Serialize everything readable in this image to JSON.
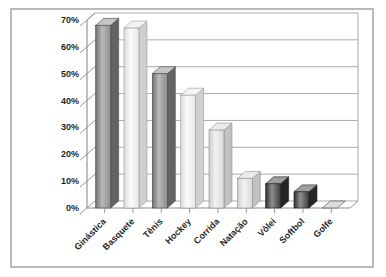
{
  "frame": {
    "border_color": "#a9a9a9",
    "background": "#ffffff"
  },
  "chart_data": {
    "type": "bar",
    "style": "3d-column",
    "title": "",
    "xlabel": "",
    "ylabel": "",
    "unit": "%",
    "categories": [
      "Ginástica",
      "Basquete",
      "Tênis",
      "Hockey",
      "Corrida",
      "Natação",
      "Vôlei",
      "Softbol",
      "Golfe"
    ],
    "values": [
      68,
      67,
      50,
      42,
      29,
      11,
      9,
      6,
      0
    ],
    "ylim": [
      0,
      70
    ],
    "ytick_step": 10,
    "y_tick_labels": [
      "0%",
      "10%",
      "20%",
      "30%",
      "40%",
      "50%",
      "60%",
      "70%"
    ],
    "grid": true,
    "legend": "none",
    "bar_styles": [
      "medium",
      "white",
      "medium",
      "white",
      "light",
      "light",
      "dark",
      "dark",
      "flat"
    ],
    "styles": {
      "medium": {
        "edge": "#6f6f6f",
        "mid": "#b9b9b9",
        "end": "#8e8e8e",
        "top": "#c6c6c6",
        "side": "#636363",
        "stroke": "#4a4a4a"
      },
      "white": {
        "edge": "#d9d9d9",
        "mid": "#fbfbfb",
        "end": "#e6e6e6",
        "top": "#f4f4f4",
        "side": "#cfcfcf",
        "stroke": "#9a9a9a"
      },
      "light": {
        "edge": "#cccccc",
        "mid": "#f2f2f2",
        "end": "#dadada",
        "top": "#ebebeb",
        "side": "#c2c2c2",
        "stroke": "#8f8f8f"
      },
      "dark": {
        "edge": "#2f2f2f",
        "mid": "#8f8f8f",
        "end": "#3c3c3c",
        "top": "#9e9e9e",
        "side": "#262626",
        "stroke": "#1d1d1d"
      },
      "flat": {
        "edge": "#c9c9c9",
        "mid": "#e2e2e2",
        "end": "#cfcfcf",
        "top": "#dcdcdc",
        "side": "#bfbfbf",
        "stroke": "#666666"
      }
    },
    "axis_color": "#8c8c8c",
    "grid_color": "#a0a0a0",
    "label_color": "#1f1f1f"
  }
}
